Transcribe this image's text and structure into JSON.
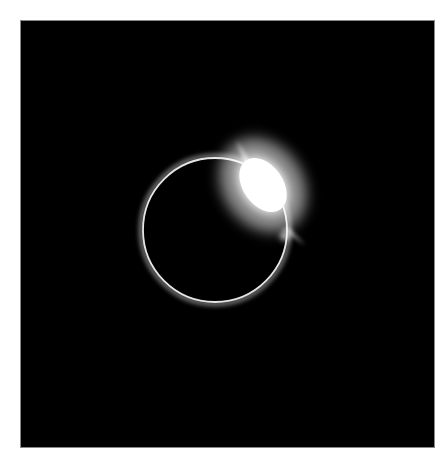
{
  "image": {
    "subject": "solar-eclipse-diamond-ring",
    "background_color": "#000000",
    "page_color": "#ffffff",
    "ring": {
      "cx": 215,
      "cy": 230,
      "r": 72,
      "color": "#e8e8e8"
    },
    "flare": {
      "cx": 263,
      "cy": 185,
      "rx": 30,
      "ry": 42,
      "rotation": -35,
      "color": "#ffffff"
    }
  }
}
